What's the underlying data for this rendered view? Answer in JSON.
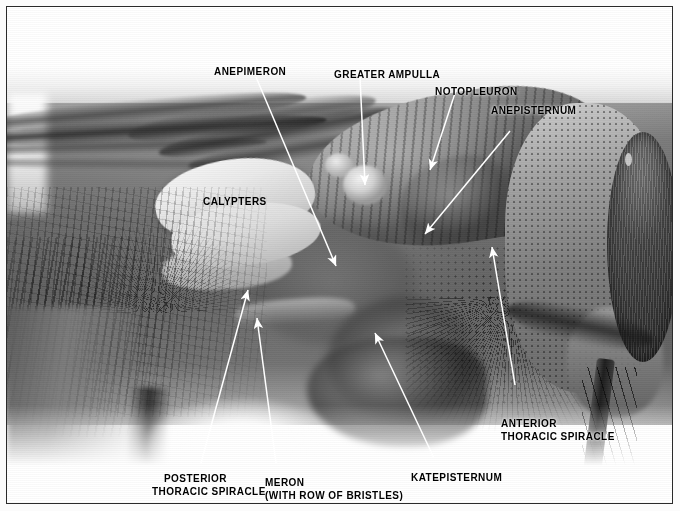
{
  "figure": {
    "type": "annotated grayscale photomicrograph",
    "border_color": "#2a2a2a",
    "label_color": "#000000",
    "leader_color": "#ffffff"
  },
  "labels": [
    {
      "id": "anepimeron",
      "text": "ANEPIMERON",
      "lines": [
        "ANEPIMERON"
      ]
    },
    {
      "id": "greater-ampulla",
      "text": "GREATER AMPULLA",
      "lines": [
        "GREATER AMPULLA"
      ]
    },
    {
      "id": "notopleuron",
      "text": "NOTOPLEURON",
      "lines": [
        "NOTOPLEURON"
      ]
    },
    {
      "id": "anepisternum",
      "text": "ANEPISTERNUM",
      "lines": [
        "ANEPISTERNUM"
      ]
    },
    {
      "id": "calypters",
      "text": "CALYPTERS",
      "lines": [
        "CALYPTERS"
      ]
    },
    {
      "id": "anterior-thoracic-spiracle",
      "text": "ANTERIOR THORACIC SPIRACLE",
      "lines": [
        "ANTERIOR",
        "THORACIC SPIRACLE"
      ]
    },
    {
      "id": "katepisternum",
      "text": "KATEPISTERNUM",
      "lines": [
        "KATEPISTERNUM"
      ]
    },
    {
      "id": "posterior-thoracic-spiracle",
      "text": "POSTERIOR THORACIC SPIRACLE",
      "lines": [
        "POSTERIOR",
        "THORACIC SPIRACLE"
      ]
    },
    {
      "id": "meron",
      "text": "MERON (WITH ROW OF BRISTLES)",
      "lines": [
        "MERON",
        "(WITH ROW OF BRISTLES)"
      ]
    }
  ],
  "label_text": {
    "anepimeron": "ANEPIMERON",
    "greater_ampulla": "GREATER AMPULLA",
    "notopleuron": "NOTOPLEURON",
    "anepisternum": "ANEPISTERNUM",
    "calypters": "CALYPTERS",
    "anterior_spiracle_l1": "ANTERIOR",
    "anterior_spiracle_l2": "THORACIC SPIRACLE",
    "katepisternum": "KATEPISTERNUM",
    "posterior_spiracle_l1": "POSTERIOR",
    "posterior_spiracle_l2": "THORACIC SPIRACLE",
    "meron_l1": "MERON",
    "meron_l2": "(WITH ROW OF BRISTLES)"
  }
}
